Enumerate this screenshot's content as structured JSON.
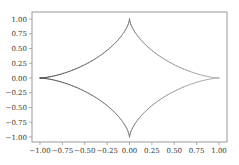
{
  "chart_data": {
    "type": "line",
    "title": "",
    "xlabel": "",
    "ylabel": "",
    "xlim": [
      -1.1,
      1.1
    ],
    "ylim": [
      -1.1,
      1.1
    ],
    "grid": false,
    "legend": null,
    "series": [
      {
        "name": "astroid",
        "equation": "x = cos^3(t), y = sin^3(t)",
        "color_start": "#555555",
        "color_end": "#bbbbbb",
        "key_points": [
          {
            "x": 1.0,
            "y": 0.0
          },
          {
            "x": 0.0,
            "y": 1.0
          },
          {
            "x": -1.0,
            "y": 0.0
          },
          {
            "x": 0.0,
            "y": -1.0
          }
        ]
      }
    ],
    "xticks": [
      -1.0,
      -0.75,
      -0.5,
      -0.25,
      0.0,
      0.25,
      0.5,
      0.75,
      1.0
    ],
    "yticks": [
      -1.0,
      -0.75,
      -0.5,
      -0.25,
      0.0,
      0.25,
      0.5,
      0.75,
      1.0
    ],
    "xtick_labels": [
      "−1.00",
      "−0.75",
      "−0.50",
      "−0.25",
      "0.00",
      "0.25",
      "0.50",
      "0.75",
      "1.00"
    ],
    "ytick_labels": [
      "−1.00",
      "−0.75",
      "−0.50",
      "−0.25",
      "0.00",
      "0.25",
      "0.50",
      "0.75",
      "1.00"
    ]
  },
  "colors": {
    "frame": "#999999",
    "tick_text": "#333333"
  }
}
